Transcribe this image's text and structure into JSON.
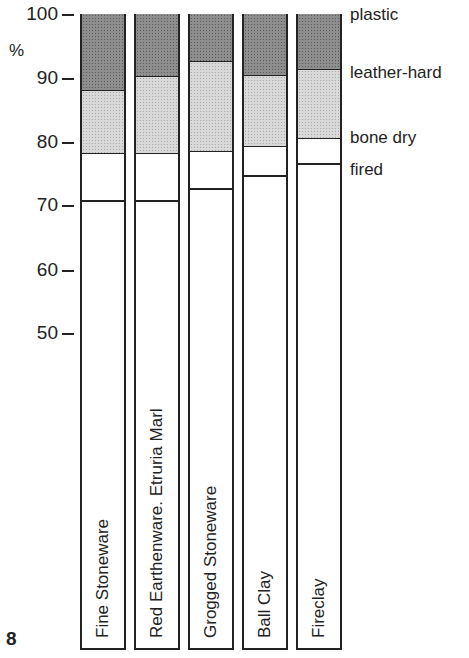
{
  "figure_number": "8",
  "y_unit": "%",
  "y_ticks": [
    {
      "label": "100",
      "y": 15
    },
    {
      "label": "90",
      "y": 79
    },
    {
      "label": "80",
      "y": 143
    },
    {
      "label": "70",
      "y": 206
    },
    {
      "label": "60",
      "y": 271
    },
    {
      "label": "50",
      "y": 334
    }
  ],
  "legend": [
    {
      "label": "plastic",
      "y": 5
    },
    {
      "label": "leather-hard",
      "y": 63
    },
    {
      "label": "bone dry",
      "y": 128
    },
    {
      "label": "fired",
      "y": 160
    }
  ],
  "bars": [
    {
      "label": "Fine Stoneware",
      "left": 80,
      "leather_top": 91,
      "bone_top": 154,
      "fired_top": 201
    },
    {
      "label": "Red Earthenware.  Etruria Marl",
      "left": 134,
      "leather_top": 77,
      "bone_top": 154,
      "fired_top": 201
    },
    {
      "label": "Grogged Stoneware",
      "left": 188,
      "leather_top": 62,
      "bone_top": 152,
      "fired_top": 189
    },
    {
      "label": "Ball Clay",
      "left": 242,
      "leather_top": 76,
      "bone_top": 147,
      "fired_top": 176
    },
    {
      "label": "Fireclay",
      "left": 296,
      "leather_top": 70,
      "bone_top": 139,
      "fired_top": 164
    }
  ],
  "chart_data": {
    "type": "bar",
    "stacked": true,
    "title": "",
    "xlabel": "",
    "ylabel": "%",
    "ylim": [
      50,
      100
    ],
    "yticks": [
      50,
      60,
      70,
      80,
      90,
      100
    ],
    "categories": [
      "Fine Stoneware",
      "Red Earthenware.  Etruria Marl",
      "Grogged Stoneware",
      "Ball Clay",
      "Fireclay"
    ],
    "series": [
      {
        "name": "plastic",
        "values": [
          100,
          100,
          100,
          100,
          100
        ]
      },
      {
        "name": "leather-hard",
        "values": [
          88.5,
          90.5,
          92.7,
          90.5,
          91.4
        ]
      },
      {
        "name": "bone dry",
        "values": [
          78.3,
          78.3,
          78.6,
          79.4,
          80.6
        ]
      },
      {
        "name": "fired",
        "values": [
          71,
          71,
          72.8,
          75,
          76.8
        ]
      }
    ],
    "legend_position": "right",
    "grid": false,
    "note": "Relative size (%) of clay bodies at each stage, plastic = 100%"
  }
}
